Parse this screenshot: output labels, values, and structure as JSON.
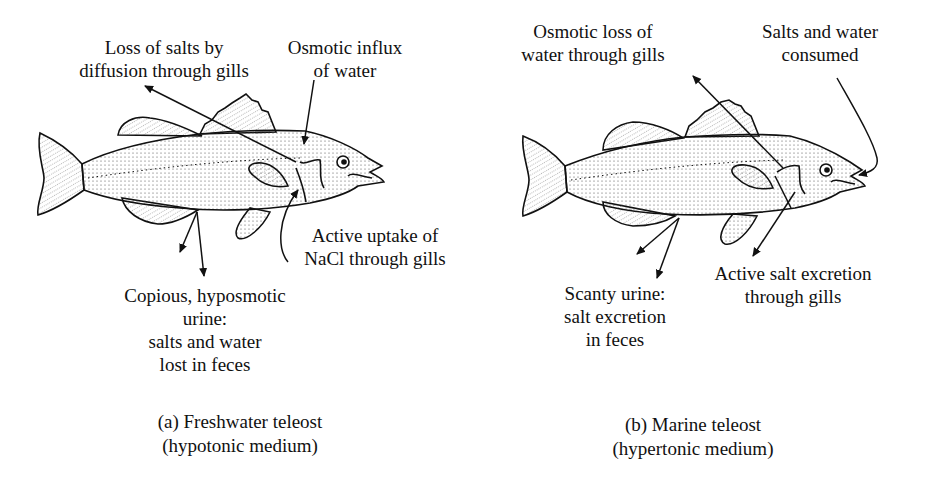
{
  "figure": {
    "panels": [
      {
        "id": "a",
        "caption_line1": "(a) Freshwater teleost",
        "caption_line2": "(hypotonic medium)",
        "labels": {
          "salt_loss": [
            "Loss of salts by",
            "diffusion through gills"
          ],
          "water_influx": [
            "Osmotic influx",
            "of water"
          ],
          "nacl_uptake": [
            "Active uptake of",
            "NaCl through gills"
          ],
          "urine": [
            "Copious, hyposmotic",
            "urine:",
            "salts and water",
            "lost in feces"
          ]
        }
      },
      {
        "id": "b",
        "caption_line1": "(b) Marine teleost",
        "caption_line2": "(hypertonic medium)",
        "labels": {
          "water_loss": [
            "Osmotic loss of",
            "water through gills"
          ],
          "consumed": [
            "Salts and water",
            "consumed"
          ],
          "salt_excretion": [
            "Active salt excretion",
            "through gills"
          ],
          "urine": [
            "Scanty urine:",
            "salt excretion",
            "in feces"
          ]
        }
      }
    ],
    "colors": {
      "ink": "#111111",
      "background": "#ffffff"
    }
  }
}
